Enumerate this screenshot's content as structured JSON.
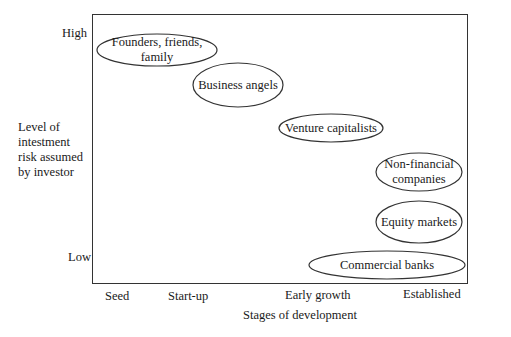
{
  "y_axis": {
    "title_lines": [
      "Level of",
      "intestment",
      "risk assumed",
      "by investor"
    ],
    "high_label": "High",
    "low_label": "Low"
  },
  "x_axis": {
    "title": "Stages of development",
    "ticks": [
      "Seed",
      "Start-up",
      "Early growth",
      "Established"
    ]
  },
  "sources": [
    {
      "lines": [
        "Founders, friends,",
        "family"
      ],
      "cx": 157,
      "cy": 50,
      "rx": 60,
      "ry": 16
    },
    {
      "lines": [
        "Business angels"
      ],
      "cx": 238,
      "cy": 85,
      "rx": 45,
      "ry": 22
    },
    {
      "lines": [
        "Venture capitalists"
      ],
      "cx": 331,
      "cy": 128,
      "rx": 52,
      "ry": 14
    },
    {
      "lines": [
        "Non-financial",
        "companies"
      ],
      "cx": 419,
      "cy": 172,
      "rx": 43,
      "ry": 19
    },
    {
      "lines": [
        "Equity markets"
      ],
      "cx": 419,
      "cy": 222,
      "rx": 43,
      "ry": 21
    },
    {
      "lines": [
        "Commercial banks"
      ],
      "cx": 387,
      "cy": 265,
      "rx": 78,
      "ry": 14
    }
  ],
  "colors": {
    "stroke": "#333333",
    "text": "#1a1a1a",
    "background": "#ffffff"
  }
}
